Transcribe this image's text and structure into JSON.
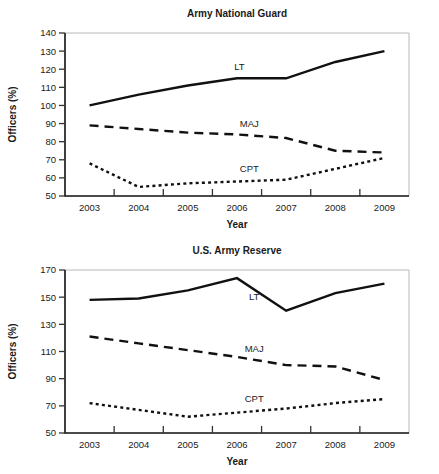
{
  "figure": {
    "axis_y_label": "Officers (%)",
    "axis_x_label": "Year"
  },
  "chart_data": [
    {
      "type": "line",
      "title": "Army National Guard",
      "xlabel": "Year",
      "ylabel": "Officers (%)",
      "categories": [
        "2003",
        "2004",
        "2005",
        "2006",
        "2007",
        "2008",
        "2009"
      ],
      "yticks": [
        50,
        60,
        70,
        80,
        90,
        100,
        110,
        120,
        130,
        140
      ],
      "ylim": [
        50,
        140
      ],
      "grid": false,
      "legend_position": "inline-labels",
      "series": [
        {
          "name": "LT",
          "style": "solid",
          "label": "LT",
          "values": [
            100,
            106,
            111,
            115,
            115,
            124,
            130
          ]
        },
        {
          "name": "MAJ",
          "style": "dashed",
          "label": "MAJ",
          "values": [
            89,
            87,
            85,
            84,
            82,
            75,
            74
          ]
        },
        {
          "name": "CPT",
          "style": "dotted",
          "label": "CPT",
          "values": [
            68,
            55,
            57,
            58,
            59,
            65,
            71
          ]
        }
      ]
    },
    {
      "type": "line",
      "title": "U.S. Army Reserve",
      "xlabel": "Year",
      "ylabel": "Officers (%)",
      "categories": [
        "2003",
        "2004",
        "2005",
        "2006",
        "2007",
        "2008",
        "2009"
      ],
      "yticks": [
        50,
        70,
        90,
        110,
        130,
        150,
        170
      ],
      "ylim": [
        50,
        170
      ],
      "grid": false,
      "legend_position": "inline-labels",
      "series": [
        {
          "name": "LT",
          "style": "solid",
          "label": "LT",
          "values": [
            148,
            149,
            155,
            164,
            140,
            153,
            160
          ]
        },
        {
          "name": "MAJ",
          "style": "dashed",
          "label": "MAJ",
          "values": [
            121,
            116,
            111,
            106,
            100,
            99,
            89
          ]
        },
        {
          "name": "CPT",
          "style": "dotted",
          "label": "CPT",
          "values": [
            72,
            67,
            62,
            65,
            68,
            72,
            75
          ]
        }
      ]
    }
  ]
}
